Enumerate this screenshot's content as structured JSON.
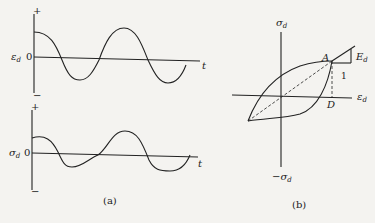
{
  "panel_a": {
    "caption": "(a)",
    "strain_plot": {
      "ylabel": "ε",
      "ylabel_sub": "d",
      "zero_label": "0",
      "plus_label": "+",
      "minus_label": "−",
      "xlabel": "t"
    },
    "stress_plot": {
      "ylabel": "σ",
      "ylabel_sub": "d",
      "zero_label": "0",
      "plus_label": "+",
      "minus_label": "−",
      "xlabel": "t"
    }
  },
  "panel_b": {
    "caption": "(b)",
    "top_axis_label": "σ",
    "top_axis_sub": "d",
    "bottom_axis_label": "−σ",
    "bottom_axis_sub": "d",
    "x_axis_label": "ε",
    "x_axis_sub": "d",
    "point_A": "A",
    "point_D": "D",
    "slope_label": "E",
    "slope_sub": "d",
    "slope_run": "1"
  },
  "colors": {
    "ink": "#222222",
    "background": "#f4f3f0"
  }
}
